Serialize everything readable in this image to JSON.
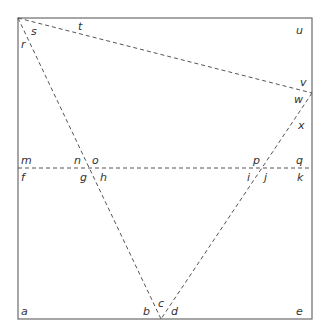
{
  "diagram": {
    "title": "",
    "colors": {
      "frame": "#777777",
      "dashed": "#555555",
      "label": "#333333"
    },
    "frame": {
      "x1": 18,
      "y1": 18,
      "x2": 312,
      "y2": 319
    },
    "lines": [
      {
        "name": "top-left-to-right-vertex",
        "x1": 18,
        "y1": 18,
        "x2": 312,
        "y2": 93
      },
      {
        "name": "top-left-to-bottom",
        "x1": 18,
        "y1": 18,
        "x2": 161,
        "y2": 319
      },
      {
        "name": "right-vertex-to-bottom",
        "x1": 312,
        "y1": 93,
        "x2": 161,
        "y2": 319
      },
      {
        "name": "horizontal-middle",
        "x1": 18,
        "y1": 168,
        "x2": 312,
        "y2": 168
      }
    ],
    "labels": [
      {
        "text": "s",
        "x": 31,
        "y": 35
      },
      {
        "text": "t",
        "x": 78,
        "y": 30
      },
      {
        "text": "r",
        "x": 21,
        "y": 48
      },
      {
        "text": "u",
        "x": 296,
        "y": 34
      },
      {
        "text": "v",
        "x": 300,
        "y": 86
      },
      {
        "text": "w",
        "x": 294,
        "y": 103
      },
      {
        "text": "x",
        "x": 298,
        "y": 129
      },
      {
        "text": "m",
        "x": 21,
        "y": 164
      },
      {
        "text": "n",
        "x": 74,
        "y": 164
      },
      {
        "text": "o",
        "x": 92,
        "y": 164
      },
      {
        "text": "p",
        "x": 253,
        "y": 164
      },
      {
        "text": "q",
        "x": 296,
        "y": 164
      },
      {
        "text": "f",
        "x": 21,
        "y": 181
      },
      {
        "text": "g",
        "x": 80,
        "y": 181
      },
      {
        "text": "h",
        "x": 100,
        "y": 181
      },
      {
        "text": "i",
        "x": 247,
        "y": 181
      },
      {
        "text": "j",
        "x": 264,
        "y": 181
      },
      {
        "text": "k",
        "x": 297,
        "y": 181
      },
      {
        "text": "a",
        "x": 21,
        "y": 315
      },
      {
        "text": "b",
        "x": 143,
        "y": 315
      },
      {
        "text": "c",
        "x": 158,
        "y": 307
      },
      {
        "text": "d",
        "x": 171,
        "y": 315
      },
      {
        "text": "e",
        "x": 296,
        "y": 315
      }
    ]
  }
}
